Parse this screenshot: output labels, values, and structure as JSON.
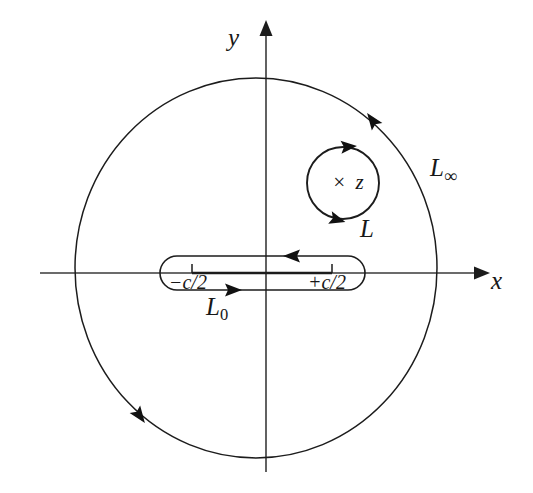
{
  "figure": {
    "kind": "complex-plane-contour-diagram",
    "background_color": "#ffffff",
    "stroke_color": "#1c1c1c",
    "axis_color": "#3a3a3a"
  },
  "axes": {
    "x_label": "x",
    "y_label": "y",
    "origin": {
      "x": 266,
      "y": 273
    }
  },
  "contours": {
    "outer": {
      "label": "L",
      "label_subscript": "∞",
      "label_full": "L∞",
      "shape": "circle",
      "center": {
        "x": 256,
        "y": 268
      },
      "radius_x": 181,
      "radius_y": 190,
      "orientation": "counterclockwise",
      "arrow_angles_deg": [
        48,
        228
      ]
    },
    "pole_circle": {
      "label": "L",
      "shape": "circle",
      "center": {
        "x": 343,
        "y": 183
      },
      "radius": 36,
      "orientation": "clockwise",
      "arrow_angles_deg": [
        95,
        270
      ]
    },
    "branch_cut": {
      "label": "L",
      "label_subscript": "0",
      "label_full": "L0",
      "shape": "racetrack",
      "left": 160,
      "right": 365,
      "center_y": 273,
      "half_height": 17,
      "top_arrow_direction": "left",
      "bottom_arrow_direction": "right"
    }
  },
  "markers": {
    "pole": {
      "glyph": "×",
      "label": "z",
      "text": "× z",
      "x": 345,
      "y": 182
    },
    "branch_points": [
      {
        "label": "−c/2",
        "x": 192,
        "y": 273
      },
      {
        "label": "+c/2",
        "x": 332,
        "y": 273
      }
    ]
  }
}
